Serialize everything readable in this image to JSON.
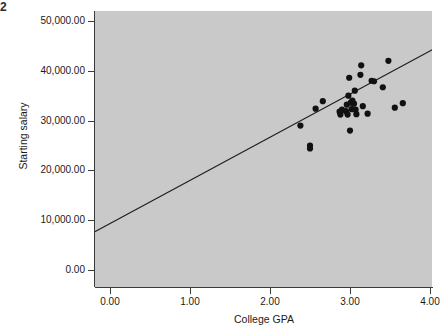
{
  "figure": {
    "corner_mark": "2",
    "background_color": "#ffffff",
    "panel_color": "#c9c9c9",
    "axis_color": "#3b3b3b",
    "marker_color": "#111111",
    "line_color": "#1a1a1a"
  },
  "chart_data": {
    "type": "scatter",
    "title": "",
    "xlabel": "College GPA",
    "ylabel": "Starting salary",
    "xlim": [
      -0.2,
      4.25
    ],
    "ylim": [
      -2000,
      52500
    ],
    "grid": false,
    "legend": null,
    "xticks": [
      0,
      1,
      2,
      3,
      4
    ],
    "xticklabels": [
      "0.00",
      "1.00",
      "2.00",
      "3.00",
      "4.00"
    ],
    "yticks": [
      0,
      10000,
      20000,
      30000,
      40000,
      50000
    ],
    "yticklabels": [
      "0.00",
      "10,000.00",
      "20,000.00",
      "30,000.00",
      "40,000.00",
      "50,000.00"
    ],
    "points": [
      {
        "x": 2.38,
        "y": 29000
      },
      {
        "x": 2.5,
        "y": 25000
      },
      {
        "x": 2.5,
        "y": 24400
      },
      {
        "x": 2.57,
        "y": 32400
      },
      {
        "x": 2.66,
        "y": 33900
      },
      {
        "x": 2.87,
        "y": 31800
      },
      {
        "x": 2.88,
        "y": 31200
      },
      {
        "x": 2.9,
        "y": 32200
      },
      {
        "x": 2.95,
        "y": 31900
      },
      {
        "x": 2.96,
        "y": 33200
      },
      {
        "x": 2.97,
        "y": 31200
      },
      {
        "x": 2.98,
        "y": 35000
      },
      {
        "x": 2.99,
        "y": 38600
      },
      {
        "x": 3.0,
        "y": 28000
      },
      {
        "x": 3.01,
        "y": 33600
      },
      {
        "x": 3.02,
        "y": 32300
      },
      {
        "x": 3.03,
        "y": 34000
      },
      {
        "x": 3.05,
        "y": 33400
      },
      {
        "x": 3.06,
        "y": 36000
      },
      {
        "x": 3.07,
        "y": 32200
      },
      {
        "x": 3.08,
        "y": 31300
      },
      {
        "x": 3.13,
        "y": 39200
      },
      {
        "x": 3.14,
        "y": 41100
      },
      {
        "x": 3.16,
        "y": 32900
      },
      {
        "x": 3.22,
        "y": 31400
      },
      {
        "x": 3.27,
        "y": 38000
      },
      {
        "x": 3.3,
        "y": 37900
      },
      {
        "x": 3.41,
        "y": 36700
      },
      {
        "x": 3.48,
        "y": 42000
      },
      {
        "x": 3.56,
        "y": 32600
      },
      {
        "x": 3.66,
        "y": 33500
      }
    ],
    "fit_line": {
      "label": "linear fit",
      "x_start": -0.19,
      "y_start": 7700,
      "x_end": 4.22,
      "y_end": 45900
    }
  }
}
